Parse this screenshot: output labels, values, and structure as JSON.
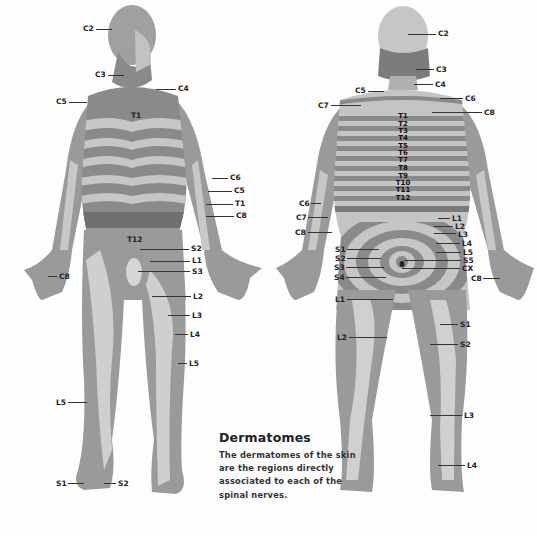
{
  "caption": {
    "title": "Dermatomes",
    "body": "The dermatomes of the skin are the regions directly associated to each of the spinal nerves."
  },
  "colors": {
    "dark_band": "#7a7a7a",
    "mid_band": "#9a9a9a",
    "light_band": "#cfcfcf",
    "label_text": "#222222"
  },
  "front_view": {
    "labels": [
      {
        "text": "C2",
        "x": 83,
        "y": 28
      },
      {
        "text": "C3",
        "x": 95,
        "y": 71
      },
      {
        "text": "C4",
        "x": 178,
        "y": 84
      },
      {
        "text": "C5",
        "x": 56,
        "y": 97
      },
      {
        "text": "T1",
        "x": 131,
        "y": 111
      },
      {
        "text": "C6",
        "x": 230,
        "y": 173
      },
      {
        "text": "C5",
        "x": 234,
        "y": 186
      },
      {
        "text": "T1",
        "x": 235,
        "y": 199
      },
      {
        "text": "C8",
        "x": 236,
        "y": 211
      },
      {
        "text": "T12",
        "x": 127,
        "y": 235
      },
      {
        "text": "S2",
        "x": 191,
        "y": 244
      },
      {
        "text": "L1",
        "x": 192,
        "y": 256
      },
      {
        "text": "S3",
        "x": 192,
        "y": 267
      },
      {
        "text": "C8",
        "x": 59,
        "y": 272
      },
      {
        "text": "L2",
        "x": 193,
        "y": 292
      },
      {
        "text": "L3",
        "x": 192,
        "y": 311
      },
      {
        "text": "L4",
        "x": 190,
        "y": 330
      },
      {
        "text": "L5",
        "x": 189,
        "y": 359
      },
      {
        "text": "L5",
        "x": 56,
        "y": 399
      },
      {
        "text": "S1",
        "x": 56,
        "y": 479
      },
      {
        "text": "S2",
        "x": 118,
        "y": 479
      }
    ]
  },
  "back_view": {
    "labels": [
      {
        "text": "C2",
        "x": 438,
        "y": 30
      },
      {
        "text": "C3",
        "x": 436,
        "y": 66
      },
      {
        "text": "C4",
        "x": 435,
        "y": 81
      },
      {
        "text": "C5",
        "x": 355,
        "y": 87
      },
      {
        "text": "C6",
        "x": 465,
        "y": 95
      },
      {
        "text": "C7",
        "x": 318,
        "y": 102
      },
      {
        "text": "C8",
        "x": 484,
        "y": 109
      },
      {
        "text": "C6",
        "x": 299,
        "y": 199
      },
      {
        "text": "C7",
        "x": 296,
        "y": 214
      },
      {
        "text": "C8",
        "x": 295,
        "y": 229
      },
      {
        "text": "L1",
        "x": 452,
        "y": 214
      },
      {
        "text": "L2",
        "x": 455,
        "y": 222
      },
      {
        "text": "L3",
        "x": 458,
        "y": 230
      },
      {
        "text": "L4",
        "x": 462,
        "y": 239
      },
      {
        "text": "L5",
        "x": 463,
        "y": 248
      },
      {
        "text": "S1",
        "x": 335,
        "y": 245
      },
      {
        "text": "S2",
        "x": 335,
        "y": 255
      },
      {
        "text": "S5",
        "x": 463,
        "y": 256
      },
      {
        "text": "S3",
        "x": 334,
        "y": 264
      },
      {
        "text": "CX",
        "x": 462,
        "y": 264
      },
      {
        "text": "S4",
        "x": 334,
        "y": 274
      },
      {
        "text": "C8",
        "x": 471,
        "y": 274
      },
      {
        "text": "L1",
        "x": 335,
        "y": 296
      },
      {
        "text": "S1",
        "x": 460,
        "y": 320
      },
      {
        "text": "L2",
        "x": 337,
        "y": 334
      },
      {
        "text": "S2",
        "x": 460,
        "y": 341
      },
      {
        "text": "L3",
        "x": 464,
        "y": 412
      },
      {
        "text": "L4",
        "x": 467,
        "y": 462
      }
    ],
    "spine_labels": [
      "T1",
      "T2",
      "T3",
      "T4",
      "T5",
      "T6",
      "T7",
      "T8",
      "T9",
      "T10",
      "T11",
      "T12"
    ]
  }
}
